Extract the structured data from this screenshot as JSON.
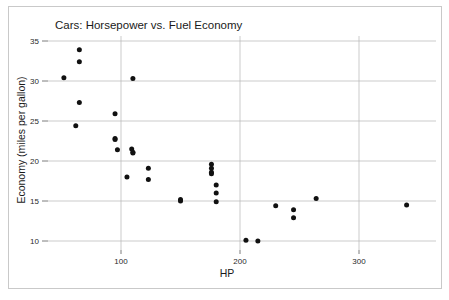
{
  "chart_data": {
    "type": "scatter",
    "title": "Cars: Horsepower vs. Fuel Economy",
    "xlabel": "HP",
    "ylabel": "Economy (miles per gallon)",
    "xlim": [
      40,
      355
    ],
    "ylim": [
      8.5,
      35.8
    ],
    "xticks": [
      100,
      200,
      300
    ],
    "xtick_labels": [
      "100",
      "200",
      "300"
    ],
    "yticks": [
      10,
      15,
      20,
      25,
      30,
      35
    ],
    "ytick_labels": [
      "10",
      "15",
      "20",
      "25",
      "30",
      "35"
    ],
    "grid": true,
    "legend": false,
    "legend_position": "none",
    "marker": "filled-circle",
    "marker_color": "#111111",
    "series": [
      {
        "name": "cars",
        "points": [
          {
            "x": 52,
            "y": 30.4
          },
          {
            "x": 65,
            "y": 33.9
          },
          {
            "x": 65,
            "y": 32.4
          },
          {
            "x": 65,
            "y": 27.3
          },
          {
            "x": 62,
            "y": 24.4
          },
          {
            "x": 95,
            "y": 25.9
          },
          {
            "x": 95,
            "y": 22.8
          },
          {
            "x": 95,
            "y": 22.7
          },
          {
            "x": 97,
            "y": 21.4
          },
          {
            "x": 109,
            "y": 21.5
          },
          {
            "x": 110,
            "y": 21.0
          },
          {
            "x": 110,
            "y": 21.1
          },
          {
            "x": 110,
            "y": 30.3
          },
          {
            "x": 105,
            "y": 18.0
          },
          {
            "x": 123,
            "y": 19.1
          },
          {
            "x": 123,
            "y": 17.7
          },
          {
            "x": 150,
            "y": 15.2
          },
          {
            "x": 150,
            "y": 15.0
          },
          {
            "x": 176,
            "y": 19.6
          },
          {
            "x": 176,
            "y": 19.1
          },
          {
            "x": 176,
            "y": 18.6
          },
          {
            "x": 176,
            "y": 18.4
          },
          {
            "x": 180,
            "y": 17.0
          },
          {
            "x": 180,
            "y": 16.0
          },
          {
            "x": 180,
            "y": 14.9
          },
          {
            "x": 205,
            "y": 10.1
          },
          {
            "x": 215,
            "y": 10.0
          },
          {
            "x": 230,
            "y": 14.4
          },
          {
            "x": 245,
            "y": 13.9
          },
          {
            "x": 245,
            "y": 12.9
          },
          {
            "x": 264,
            "y": 15.3
          },
          {
            "x": 340,
            "y": 14.5
          }
        ]
      }
    ]
  }
}
